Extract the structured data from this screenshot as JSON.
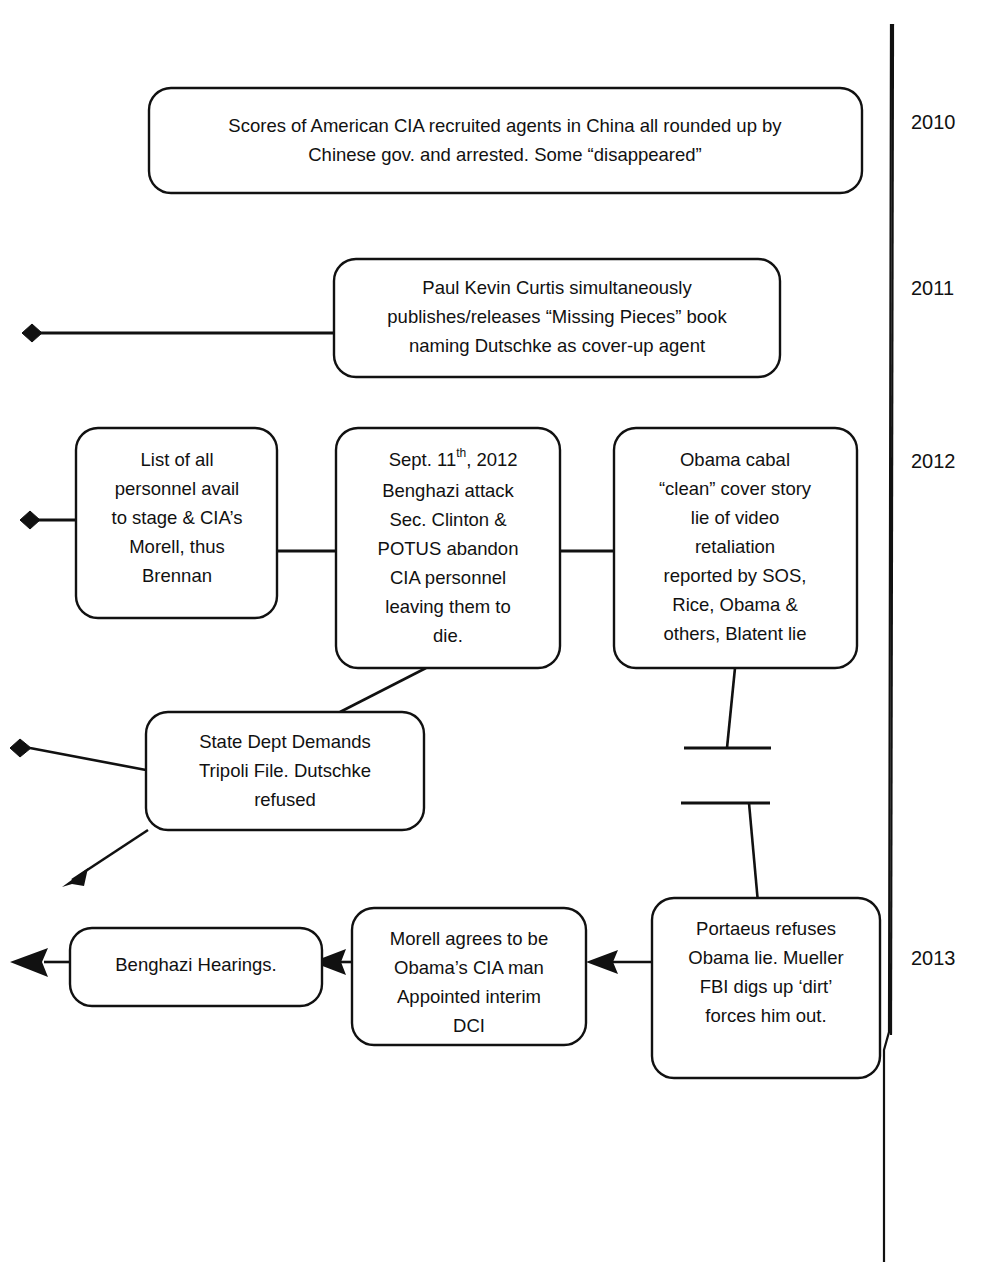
{
  "diagram": {
    "background_color": "#ffffff",
    "line_color": "#111111",
    "box_fill": "#ffffff"
  },
  "timeline": {
    "axis_name": "year-axis",
    "years": [
      {
        "label": "2010",
        "y": 124
      },
      {
        "label": "2011",
        "y": 290
      },
      {
        "label": "2012",
        "y": 463
      },
      {
        "label": "2013",
        "y": 960
      }
    ]
  },
  "nodes": [
    {
      "id": "china-agents",
      "name": "node-china-agents",
      "lines": [
        "Scores of American CIA recruited agents in China all rounded up by",
        "Chinese gov. and arrested. Some “disappeared”"
      ]
    },
    {
      "id": "curtis-book",
      "name": "node-curtis-book",
      "lines": [
        "Paul Kevin Curtis simultaneously",
        "publishes/releases “Missing Pieces” book",
        "naming Dutschke as cover-up agent"
      ]
    },
    {
      "id": "personnel-list",
      "name": "node-personnel-list",
      "lines": [
        "List of all",
        "personnel avail",
        "to stage & CIA’s",
        "Morell, thus",
        "Brennan"
      ]
    },
    {
      "id": "benghazi-attack",
      "name": "node-benghazi-attack",
      "lines": [
        "Sept. 11",
        "Benghazi attack",
        "Sec. Clinton &",
        "POTUS abandon",
        "CIA personnel",
        "leaving them to",
        "die."
      ],
      "superscript": "th",
      "line0_suffix": ", 2012"
    },
    {
      "id": "obama-cabal",
      "name": "node-obama-cabal",
      "lines": [
        "Obama cabal",
        "“clean” cover story",
        "lie of video",
        "retaliation",
        "reported by SOS,",
        "Rice, Obama &",
        "others, Blatent lie"
      ]
    },
    {
      "id": "state-dept",
      "name": "node-state-dept",
      "lines": [
        "State Dept Demands",
        "Tripoli File. Dutschke",
        "refused"
      ]
    },
    {
      "id": "portaeus",
      "name": "node-portaeus",
      "lines": [
        "Portaeus refuses",
        "Obama lie. Mueller",
        "FBI digs up ‘dirt’",
        "forces him out."
      ]
    },
    {
      "id": "morell-dci",
      "name": "node-morell-dci",
      "lines": [
        "Morell agrees to be",
        "Obama’s CIA man",
        "Appointed interim",
        "DCI"
      ]
    },
    {
      "id": "benghazi-hearings",
      "name": "node-benghazi-hearings",
      "lines": [
        "Benghazi Hearings."
      ]
    }
  ]
}
